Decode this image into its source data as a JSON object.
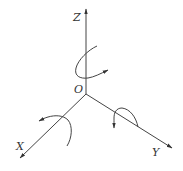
{
  "diagram": {
    "title": "",
    "origin_label": "O",
    "axes": [
      {
        "name": "Z",
        "label": "Z",
        "direction": "up"
      },
      {
        "name": "X",
        "label": "X",
        "direction": "down-left"
      },
      {
        "name": "Y",
        "label": "Y",
        "direction": "down-right"
      }
    ],
    "rotation_arrows": [
      {
        "axis": "Z",
        "description": "rotation arrow around Z axis"
      },
      {
        "axis": "X",
        "description": "rotation arrow around X axis"
      },
      {
        "axis": "Y",
        "description": "rotation arrow around Y axis"
      }
    ],
    "colors": {
      "line": "#444444",
      "background": "#ffffff"
    }
  }
}
